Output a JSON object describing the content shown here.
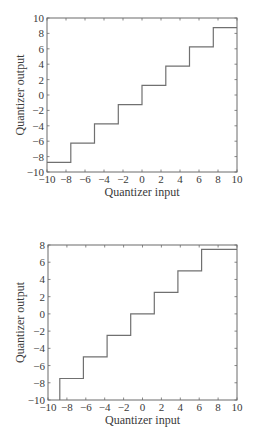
{
  "chart_data": [
    {
      "type": "line",
      "subtype": "step",
      "title": "",
      "xlabel": "Quantizer input",
      "ylabel": "Quantizer output",
      "xlim": [
        -10,
        10
      ],
      "ylim": [
        -10,
        10
      ],
      "xticks": [
        -10,
        -8,
        -6,
        -4,
        -2,
        0,
        2,
        4,
        6,
        8,
        10
      ],
      "yticks": [
        -10,
        -8,
        -6,
        -4,
        -2,
        0,
        2,
        4,
        6,
        8,
        10
      ],
      "grid": false,
      "line_color": "#707070",
      "series": [
        {
          "name": "Midrise quantizer",
          "x": [
            -10,
            -7.5,
            -7.5,
            -5,
            -5,
            -2.5,
            -2.5,
            0,
            0,
            2.5,
            2.5,
            5,
            5,
            7.5,
            7.5,
            10
          ],
          "y": [
            -8.75,
            -8.75,
            -6.25,
            -6.25,
            -3.75,
            -3.75,
            -1.25,
            -1.25,
            1.25,
            1.25,
            3.75,
            3.75,
            6.25,
            6.25,
            8.75,
            8.75
          ]
        }
      ],
      "levels": [
        -8.75,
        -6.25,
        -3.75,
        -1.25,
        1.25,
        3.75,
        6.25,
        8.75
      ],
      "thresholds": [
        -7.5,
        -5,
        -2.5,
        0,
        2.5,
        5,
        7.5
      ]
    },
    {
      "type": "line",
      "subtype": "step",
      "title": "",
      "xlabel": "Quantizer input",
      "ylabel": "Quantizer output",
      "xlim": [
        -10,
        10
      ],
      "ylim": [
        -10,
        8
      ],
      "xticks": [
        -10,
        -8,
        -6,
        -4,
        -2,
        0,
        2,
        4,
        6,
        8,
        10
      ],
      "yticks": [
        -10,
        -8,
        -6,
        -4,
        -2,
        0,
        2,
        4,
        6,
        8
      ],
      "grid": false,
      "line_color": "#707070",
      "series": [
        {
          "name": "Midtread quantizer",
          "x": [
            -8.75,
            -8.75,
            -6.25,
            -6.25,
            -3.75,
            -3.75,
            -1.25,
            -1.25,
            1.25,
            1.25,
            3.75,
            3.75,
            6.25,
            6.25,
            10
          ],
          "y": [
            -10,
            -7.5,
            -7.5,
            -5,
            -5,
            -2.5,
            -2.5,
            0,
            0,
            2.5,
            2.5,
            5,
            5,
            7.5,
            7.5
          ]
        }
      ],
      "levels": [
        -10,
        -7.5,
        -5,
        -2.5,
        0,
        2.5,
        5,
        7.5
      ],
      "thresholds": [
        -8.75,
        -6.25,
        -3.75,
        -1.25,
        1.25,
        3.75,
        6.25
      ]
    }
  ],
  "layout": [
    {
      "box": {
        "x0": 47,
        "y0": 18,
        "x1": 237,
        "y1": 172
      }
    },
    {
      "box": {
        "x0": 48,
        "y0": 17,
        "x1": 237,
        "y1": 172
      }
    }
  ],
  "colors": {
    "axis": "#6a6a6a",
    "line": "#707070",
    "text": "#3a3a3a"
  }
}
